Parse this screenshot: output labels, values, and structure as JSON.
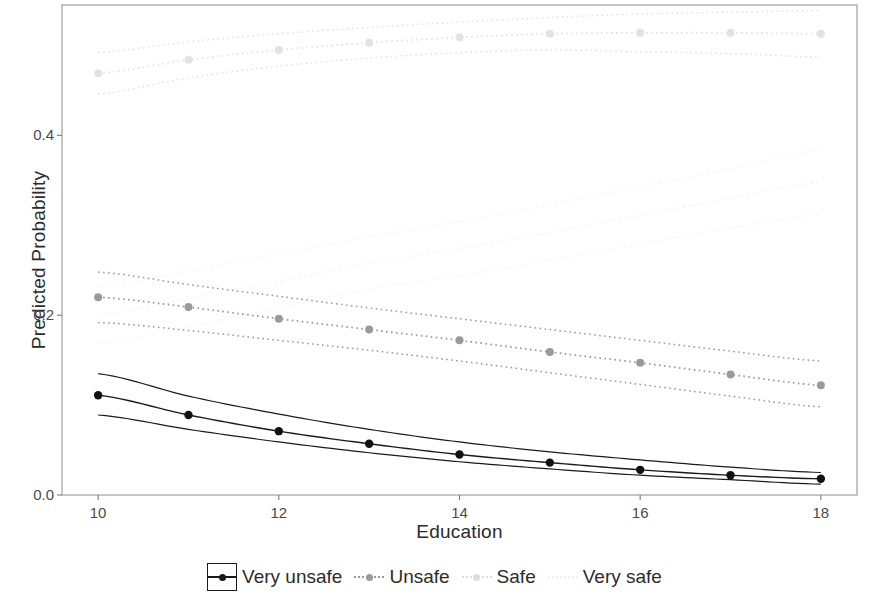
{
  "chart_data": {
    "type": "line",
    "title": "",
    "xlabel": "Education",
    "ylabel": "Predicted Probability",
    "x": [
      10,
      11,
      12,
      13,
      14,
      15,
      16,
      17,
      18
    ],
    "xlim": [
      9.6,
      18.4
    ],
    "ylim": [
      0.0,
      0.545
    ],
    "xticks": [
      10,
      12,
      14,
      16,
      18
    ],
    "xtick_labels": [
      "10",
      "12",
      "14",
      "16",
      "18"
    ],
    "yticks": [
      0.0,
      0.2,
      0.4
    ],
    "ytick_labels": [
      "0.0",
      "0.2",
      "0.4"
    ],
    "grid": false,
    "legend_position": "bottom",
    "series": [
      {
        "name": "Very unsafe",
        "color": "#1a1a1a",
        "linestyle": "solid",
        "marker": "circle",
        "values": [
          0.111,
          0.089,
          0.071,
          0.057,
          0.045,
          0.036,
          0.028,
          0.022,
          0.018
        ],
        "ci_upper": [
          0.135,
          0.11,
          0.09,
          0.073,
          0.059,
          0.048,
          0.039,
          0.031,
          0.025
        ],
        "ci_lower": [
          0.089,
          0.073,
          0.059,
          0.047,
          0.037,
          0.029,
          0.022,
          0.017,
          0.012
        ]
      },
      {
        "name": "Unsafe",
        "color": "#9a9a9a",
        "linestyle": "dotted",
        "marker": "circle",
        "values": [
          0.22,
          0.209,
          0.196,
          0.184,
          0.172,
          0.159,
          0.147,
          0.134,
          0.122
        ],
        "ci_upper": [
          0.248,
          0.234,
          0.221,
          0.208,
          0.196,
          0.184,
          0.172,
          0.16,
          0.149
        ],
        "ci_lower": [
          0.192,
          0.183,
          0.172,
          0.161,
          0.149,
          0.136,
          0.123,
          0.11,
          0.098
        ]
      },
      {
        "name": "Safe",
        "color": "#e2e2e2",
        "linestyle": "dotted",
        "marker": "circle",
        "values": [
          0.469,
          0.484,
          0.495,
          0.503,
          0.509,
          0.513,
          0.514,
          0.514,
          0.513
        ],
        "ci_upper": [
          0.492,
          0.504,
          0.513,
          0.52,
          0.526,
          0.531,
          0.535,
          0.537,
          0.539
        ],
        "ci_lower": [
          0.446,
          0.464,
          0.477,
          0.486,
          0.492,
          0.495,
          0.493,
          0.491,
          0.487
        ]
      },
      {
        "name": "Very safe",
        "color": "#f3f3f3",
        "linestyle": "dotted",
        "marker": "none",
        "values": [
          0.2,
          0.218,
          0.238,
          0.258,
          0.274,
          0.292,
          0.311,
          0.33,
          0.348
        ],
        "ci_upper": [
          0.232,
          0.249,
          0.268,
          0.287,
          0.304,
          0.323,
          0.343,
          0.363,
          0.384
        ],
        "ci_lower": [
          0.168,
          0.187,
          0.208,
          0.229,
          0.244,
          0.261,
          0.279,
          0.297,
          0.312
        ]
      }
    ]
  },
  "axes": {
    "xlabel": "Education",
    "ylabel": "Predicted Probability"
  },
  "legend": {
    "entries": [
      {
        "label": "Very unsafe",
        "color": "#1a1a1a",
        "style": "solid",
        "boxed": true
      },
      {
        "label": "Unsafe",
        "color": "#9a9a9a",
        "style": "dotted",
        "boxed": false
      },
      {
        "label": "Safe",
        "color": "#dcdcdc",
        "style": "dotted",
        "boxed": false
      },
      {
        "label": "Very safe",
        "color": "#efefef",
        "style": "dotted",
        "boxed": false
      }
    ]
  },
  "panel": {
    "border_color": "#9e9e9e",
    "background": "#ffffff"
  }
}
